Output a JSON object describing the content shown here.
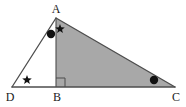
{
  "figure": {
    "type": "geometry-diagram",
    "width": 186,
    "height": 107,
    "background_color": "#ffffff",
    "stroke_color": "#4d4d4d",
    "shaded_fill_color": "#a8a8a8",
    "marker_color": "#111111",
    "label_color": "#1a1a1a"
  },
  "points": {
    "A": {
      "label": "A",
      "x": 56,
      "y": 18,
      "label_x": 56,
      "label_y": 13
    },
    "B": {
      "label": "B",
      "x": 56,
      "y": 87,
      "label_x": 57,
      "label_y": 101
    },
    "C": {
      "label": "C",
      "x": 175,
      "y": 87,
      "label_x": 176,
      "label_y": 101
    },
    "D": {
      "label": "D",
      "x": 12,
      "y": 87,
      "label_x": 10,
      "label_y": 101
    }
  },
  "segments": [
    {
      "name": "DA",
      "from": "D",
      "to": "A"
    },
    {
      "name": "AC",
      "from": "A",
      "to": "C"
    },
    {
      "name": "DC",
      "from": "D",
      "to": "C"
    },
    {
      "name": "AB",
      "from": "A",
      "to": "B"
    }
  ],
  "shaded_region": {
    "name": "triangle-ABC",
    "vertices": [
      "A",
      "B",
      "C"
    ],
    "fill": "#a8a8a8"
  },
  "right_angle": {
    "at": "B",
    "size": 9,
    "direction": "up-right"
  },
  "angle_markers": [
    {
      "name": "angle-marker-D-star",
      "shape": "star",
      "x": 27,
      "y": 80
    },
    {
      "name": "angle-marker-A-dot",
      "shape": "dot",
      "x": 51,
      "y": 34
    },
    {
      "name": "angle-marker-A-star",
      "shape": "star",
      "x": 60,
      "y": 29
    },
    {
      "name": "angle-marker-C-dot",
      "shape": "dot",
      "x": 154,
      "y": 80
    }
  ],
  "marker_sizes": {
    "dot_radius": 4.2,
    "star_outer_radius": 5.0,
    "star_inner_radius": 2.1
  }
}
